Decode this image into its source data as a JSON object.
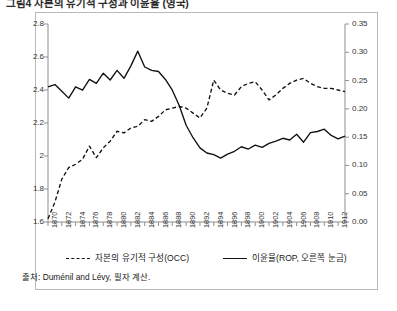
{
  "figure": {
    "title": "그림4  자본의 유기적 구성과 이윤율 (영국)",
    "source": "출처: Duménil and Lévy, 필자 계산."
  },
  "legend": {
    "position": "below-plot",
    "items": [
      {
        "label": "자본의 유기적 구성(OCC)",
        "style": "dashed",
        "color": "#111111"
      },
      {
        "label": "이윤율(ROP, 오른쪽 눈금)",
        "style": "solid",
        "color": "#111111"
      }
    ]
  },
  "axes": {
    "left": {
      "ticks": [
        "1.6",
        "1.8",
        "2",
        "2.2",
        "2.4",
        "2.6",
        "2.8"
      ],
      "min": 1.6,
      "max": 2.8,
      "step": 0.2
    },
    "right": {
      "ticks": [
        "0.00",
        "0.05",
        "0.10",
        "0.15",
        "0.20",
        "0.25",
        "0.30",
        "0.35"
      ],
      "min": 0.0,
      "max": 0.35,
      "step": 0.05
    },
    "bottom": {
      "ticks": [
        "1870",
        "1872",
        "1874",
        "1876",
        "1878",
        "1880",
        "1882",
        "1884",
        "1886",
        "1888",
        "1890",
        "1892",
        "1894",
        "1896",
        "1898",
        "1900",
        "1902",
        "1904",
        "1906",
        "1908",
        "1910",
        "1912"
      ],
      "min": 1870,
      "max": 1913,
      "step": 2
    }
  },
  "chart_data": {
    "type": "line",
    "title": "그림4  자본의 유기적 구성과 이윤율 (영국)",
    "xlabel": "",
    "ylabel": "",
    "grid": false,
    "legend_position": "bottom",
    "xlim": [
      1870,
      1913
    ],
    "ylim": [
      1.6,
      2.8
    ],
    "y2lim": [
      0.0,
      0.35
    ],
    "x": [
      1870,
      1871,
      1872,
      1873,
      1874,
      1875,
      1876,
      1877,
      1878,
      1879,
      1880,
      1881,
      1882,
      1883,
      1884,
      1885,
      1886,
      1887,
      1888,
      1889,
      1890,
      1891,
      1892,
      1893,
      1894,
      1895,
      1896,
      1897,
      1898,
      1899,
      1900,
      1901,
      1902,
      1903,
      1904,
      1905,
      1906,
      1907,
      1908,
      1909,
      1910,
      1911,
      1912,
      1913
    ],
    "series": [
      {
        "name": "자본의 유기적 구성(OCC)",
        "axis": "left",
        "style": "dashed",
        "color": "#111111",
        "values": [
          1.62,
          1.72,
          1.86,
          1.93,
          1.95,
          1.98,
          2.06,
          1.99,
          2.05,
          2.09,
          2.15,
          2.14,
          2.17,
          2.18,
          2.22,
          2.21,
          2.24,
          2.28,
          2.29,
          2.3,
          2.29,
          2.26,
          2.23,
          2.29,
          2.46,
          2.4,
          2.38,
          2.37,
          2.42,
          2.44,
          2.45,
          2.4,
          2.34,
          2.37,
          2.41,
          2.44,
          2.46,
          2.47,
          2.44,
          2.42,
          2.41,
          2.41,
          2.4,
          2.39
        ]
      },
      {
        "name": "이윤율(ROP, 오른쪽 눈금)",
        "axis": "right",
        "style": "solid",
        "color": "#111111",
        "values": [
          0.239,
          0.243,
          0.231,
          0.219,
          0.239,
          0.233,
          0.252,
          0.245,
          0.263,
          0.251,
          0.268,
          0.254,
          0.276,
          0.302,
          0.274,
          0.268,
          0.266,
          0.252,
          0.233,
          0.206,
          0.171,
          0.149,
          0.131,
          0.122,
          0.119,
          0.113,
          0.12,
          0.125,
          0.133,
          0.129,
          0.136,
          0.132,
          0.139,
          0.143,
          0.148,
          0.145,
          0.155,
          0.141,
          0.158,
          0.16,
          0.164,
          0.153,
          0.147,
          0.152
        ]
      }
    ]
  }
}
